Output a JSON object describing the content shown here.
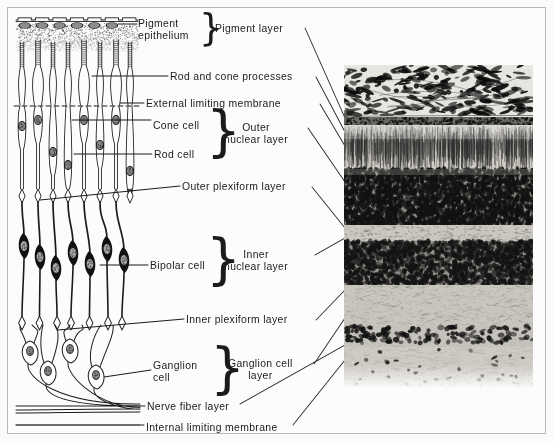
{
  "figure": {
    "background": "#fcfcfb",
    "border_color": "#b9b9b9",
    "ink": "#1b1b1b"
  },
  "diagram_labels": [
    {
      "id": "pigment-epithelium",
      "lines": [
        "Pigment",
        "epithelium"
      ],
      "x": 138,
      "y": 18,
      "align": "left"
    },
    {
      "id": "rod-and-cone-processes",
      "lines": [
        "Rod and cone processes"
      ],
      "x": 170,
      "y": 71,
      "align": "left"
    },
    {
      "id": "external-limiting-membrane",
      "lines": [
        "External limiting membrane"
      ],
      "x": 146,
      "y": 98,
      "align": "left"
    },
    {
      "id": "cone-cell",
      "lines": [
        "Cone cell"
      ],
      "x": 153,
      "y": 120,
      "align": "left"
    },
    {
      "id": "rod-cell",
      "lines": [
        "Rod cell"
      ],
      "x": 154,
      "y": 149,
      "align": "left"
    },
    {
      "id": "outer-plexiform-layer",
      "lines": [
        "Outer plexiform layer"
      ],
      "x": 182,
      "y": 181,
      "align": "left"
    },
    {
      "id": "bipolar-cell",
      "lines": [
        "Bipolar cell"
      ],
      "x": 150,
      "y": 260,
      "align": "left"
    },
    {
      "id": "inner-plexiform-layer",
      "lines": [
        "Inner plexiform layer"
      ],
      "x": 186,
      "y": 314,
      "align": "left"
    },
    {
      "id": "ganglion-cell",
      "lines": [
        "Ganglion",
        "cell"
      ],
      "x": 153,
      "y": 360,
      "align": "left"
    },
    {
      "id": "nerve-fiber-layer",
      "lines": [
        "Nerve fiber layer"
      ],
      "x": 147,
      "y": 401,
      "align": "left"
    },
    {
      "id": "internal-limiting-membrane",
      "lines": [
        "Internal limiting membrane"
      ],
      "x": 146,
      "y": 422,
      "align": "left"
    }
  ],
  "layer_labels": [
    {
      "id": "pigment-layer",
      "lines": [
        "Pigment layer"
      ],
      "x": 215,
      "y": 23,
      "brace_x": 199,
      "brace_y": 16,
      "brace_h": 26
    },
    {
      "id": "outer-nuclear-layer",
      "lines": [
        "Outer",
        "nuclear layer"
      ],
      "x": 224,
      "y": 122,
      "brace_x": 206,
      "brace_y": 114,
      "brace_h": 38
    },
    {
      "id": "inner-nuclear-layer",
      "lines": [
        "Inner",
        "nuclear layer"
      ],
      "x": 224,
      "y": 249,
      "brace_x": 206,
      "brace_y": 242,
      "brace_h": 38
    },
    {
      "id": "ganglion-cell-layer",
      "lines": [
        "Ganglion cell",
        "layer"
      ],
      "x": 228,
      "y": 358,
      "brace_x": 210,
      "brace_y": 351,
      "brace_h": 38
    }
  ],
  "micrograph": {
    "id": "retina-micrograph",
    "x": 344,
    "y": 65,
    "width": 189,
    "height": 323,
    "bands": [
      {
        "name": "choroid-pigment",
        "top": 0,
        "height": 52,
        "tone": "very-dark-mottled"
      },
      {
        "name": "pigment-epithelium-line",
        "top": 52,
        "height": 8,
        "tone": "dark-line"
      },
      {
        "name": "rod-and-cone-processes",
        "top": 60,
        "height": 44,
        "tone": "striated-light"
      },
      {
        "name": "outer-nuclear-layer",
        "top": 104,
        "height": 56,
        "tone": "dark-granular"
      },
      {
        "name": "outer-plexiform-layer",
        "top": 160,
        "height": 16,
        "tone": "pale"
      },
      {
        "name": "inner-nuclear-layer",
        "top": 176,
        "height": 44,
        "tone": "dark-granular"
      },
      {
        "name": "inner-plexiform-layer",
        "top": 220,
        "height": 40,
        "tone": "pale-fibrous"
      },
      {
        "name": "ganglion-cell-layer",
        "top": 260,
        "height": 22,
        "tone": "scattered-dark-nuclei"
      },
      {
        "name": "nerve-fiber-layer",
        "top": 282,
        "height": 41,
        "tone": "pale-fibrous"
      }
    ]
  },
  "leader_lines": [
    {
      "from": "pigment-layer",
      "x1": 305,
      "y1": 28,
      "x2": 345,
      "y2": 118
    },
    {
      "from": "rod-and-cone-processes",
      "x1": 316,
      "y1": 77,
      "x2": 345,
      "y2": 132
    },
    {
      "from": "external-limiting-membrane",
      "x1": 320,
      "y1": 104,
      "x2": 345,
      "y2": 146
    },
    {
      "from": "outer-nuclear-layer",
      "x1": 308,
      "y1": 128,
      "x2": 345,
      "y2": 182
    },
    {
      "from": "outer-plexiform-layer",
      "x1": 312,
      "y1": 187,
      "x2": 345,
      "y2": 228
    },
    {
      "from": "inner-nuclear-layer",
      "x1": 315,
      "y1": 255,
      "x2": 345,
      "y2": 238
    },
    {
      "from": "inner-plexiform-layer",
      "x1": 316,
      "y1": 320,
      "x2": 345,
      "y2": 290
    },
    {
      "from": "ganglion-cell-layer",
      "x1": 314,
      "y1": 364,
      "x2": 345,
      "y2": 318
    },
    {
      "from": "nerve-fiber-layer",
      "x1": 240,
      "y1": 404,
      "x2": 345,
      "y2": 345
    },
    {
      "from": "internal-limiting-membrane",
      "x1": 293,
      "y1": 425,
      "x2": 345,
      "y2": 360
    }
  ]
}
